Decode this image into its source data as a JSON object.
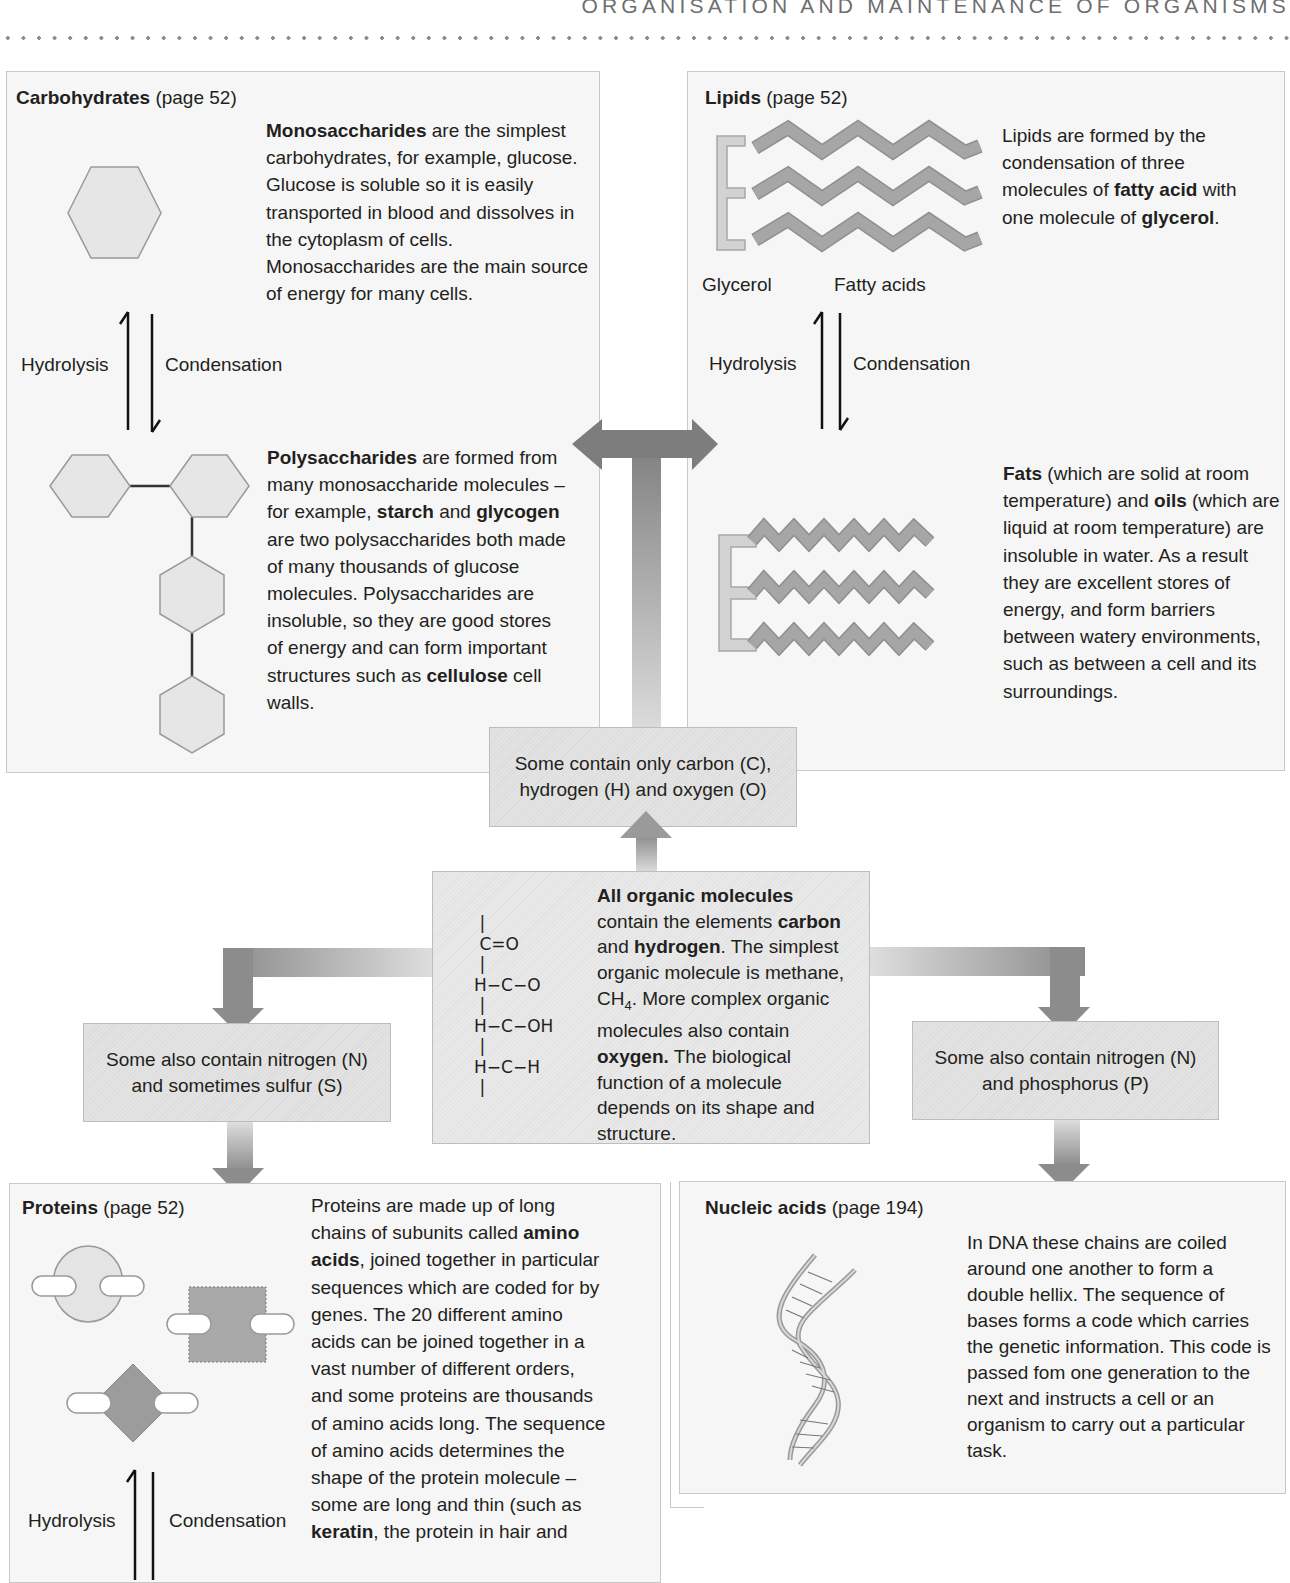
{
  "page": {
    "running_head": "ORGANISATION AND MAINTENANCE OF ORGANISMS"
  },
  "carbohydrates": {
    "title_bold": "Carbohydrates",
    "title_ref": "(page 52)",
    "mono_bold": "Monosaccharides",
    "mono_text": " are the simplest carbohydrates, for example, glucose. Glucose is soluble so it is easily transported in blood and dissolves in the cytoplasm of cells. Monosaccharides are the main source of energy for many cells.",
    "poly_bold": "Polysaccharides",
    "poly_text_1": " are formed from many monosaccharide molecules – for example, ",
    "poly_bold_starch": "starch",
    "poly_text_2": " and ",
    "poly_bold_glycogen": "glycogen",
    "poly_text_3": " are two polysaccharides both made of many thousands of glucose molecules. Polysaccharides are insoluble, so they are good stores of energy and can form important structures such as ",
    "poly_bold_cellulose": "cellulose",
    "poly_text_4": " cell walls.",
    "hydrolysis": "Hydrolysis",
    "condensation": "Condensation"
  },
  "lipids": {
    "title_bold": "Lipids",
    "title_ref": "(page 52)",
    "intro_text_1": "Lipids are formed by the condensation of three molecules of ",
    "intro_bold_fatty": "fatty acid",
    "intro_text_2": " with one molecule of ",
    "intro_bold_glycerol": "glycerol",
    "intro_text_3": ".",
    "glycerol_label": "Glycerol",
    "fatty_acids_label": "Fatty acids",
    "hydrolysis": "Hydrolysis",
    "condensation": "Condensation",
    "fats_bold": "Fats",
    "fats_text_1": " (which are solid at room temperature) and ",
    "oils_bold": "oils",
    "fats_text_2": " (which are liquid at room temperature) are insoluble in water. As a result they are excellent stores of energy, and form barriers between watery environments, such as between a cell and its surroundings."
  },
  "boxes": {
    "cho": "Some contain only carbon (C), hydrogen (H) and oxygen (O)",
    "ns": "Some also contain nitrogen (N) and sometimes sulfur (S)",
    "np": "Some also contain nitrogen (N) and phosphorus (P)"
  },
  "center": {
    "formula": " |\n C=O\n |\nH−C−O\n |\nH−C−OH\n |\nH−C−H\n |",
    "bold_1": "All organic molecules",
    "text_1": " contain the elements ",
    "bold_carbon": "carbon",
    "text_2": " and ",
    "bold_hydrogen": "hydrogen",
    "text_3": ". The simplest organic molecule is methane, CH",
    "sub_4": "4",
    "text_4": ". More complex organic molecules also contain ",
    "bold_oxygen": "oxygen.",
    "text_5": " The biological function of a molecule depends on its shape and structure."
  },
  "proteins": {
    "title_bold": "Proteins",
    "title_ref": "(page 52)",
    "text_1": "Proteins are made up of long chains of subunits called ",
    "bold_amino": "amino acids",
    "text_2": ", joined together in particular sequences which are coded for by genes. The 20 different amino acids can be joined together in a vast number of different orders, and some proteins are thousands of amino acids long. The sequence of amino acids determines the shape of the protein molecule – some are long and thin (such as ",
    "bold_keratin": "keratin",
    "text_3": ", the protein in hair and",
    "hydrolysis": "Hydrolysis",
    "condensation": "Condensation"
  },
  "nucleic_acids": {
    "title_bold": "Nucleic acids",
    "title_ref": "(page 194)",
    "text": "In DNA these chains are coiled around one another to form a double hellix. The sequence of bases forms a code which carries the genetic information. This code is passed fom one generation to the next and instructs a cell or an organism to carry out a particular task."
  },
  "colors": {
    "panel_bg": "#f6f6f6",
    "panel_border": "#c8c8c8",
    "arrow_dark": "#8c8c8c",
    "arrow_light": "#d6d6d6",
    "shape_fill": "#e6e6e6",
    "shape_stroke": "#9a9a9a",
    "chain_fill": "#a3a3a3"
  }
}
